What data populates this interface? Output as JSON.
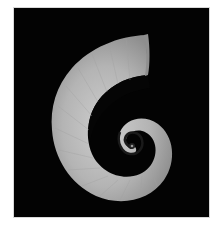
{
  "image": {
    "subject": "spiral shell on black background",
    "description": "Gray ram's-horn style spiral shell, opening at upper right, coiling to small center",
    "colors": {
      "background": "#ffffff",
      "panel": "#030303",
      "shell_light": "#c8c8c8",
      "shell_mid": "#a9a9a9",
      "shell_dark": "#7a7a7a",
      "border": "#d8d8d8"
    }
  }
}
